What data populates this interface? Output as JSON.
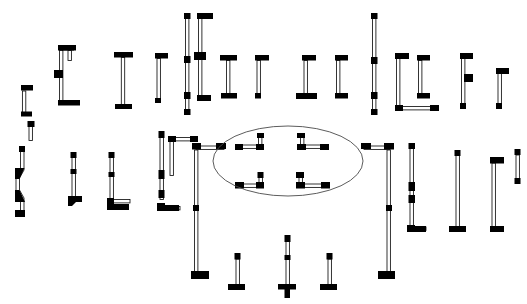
{
  "diagram": {
    "background_color": "#ffffff",
    "wall_line_color": "#111111",
    "wall_cap_color": "#000000",
    "wall_fill_color": "#ffffff",
    "highlight_color": "#4a4a4a",
    "canvas": {
      "width": 527,
      "height": 304
    },
    "annotation": {
      "shape": "ellipse",
      "name": "center-highlight-ellipse",
      "cx": 288,
      "cy": 161,
      "rx": 75,
      "ry": 35,
      "stroke": "#4a4a4a"
    },
    "legend": {
      "cap_label": "end cap",
      "body_label": "wall body",
      "joint_label": "joint marker"
    },
    "counts": {
      "total_segments": 46,
      "highlighted_segments": 4,
      "rows": 4
    }
  },
  "segments": [
    {
      "id": "s01",
      "name": "corner-top-left-small",
      "row": 1,
      "x": 22,
      "y": 85,
      "w": 12,
      "h": 28,
      "type": "corner-TL",
      "thickness": 4
    },
    {
      "id": "s02",
      "name": "bracket-left-open-right",
      "row": 1,
      "x": 55,
      "y": 45,
      "w": 22,
      "h": 60,
      "type": "bracket-C",
      "thickness": 4,
      "joint": "mid-left"
    },
    {
      "id": "s03",
      "name": "tee-vertical-top",
      "row": 1,
      "x": 110,
      "y": 52,
      "w": 20,
      "h": 58,
      "type": "tee-top",
      "thickness": 4
    },
    {
      "id": "s04",
      "name": "corner-top-right-thin",
      "row": 1,
      "x": 152,
      "y": 53,
      "w": 12,
      "h": 48,
      "type": "corner-TR",
      "thickness": 4
    },
    {
      "id": "s05",
      "name": "long-vertical-left",
      "row": 1,
      "x": 184,
      "y": 13,
      "w": 8,
      "h": 103,
      "type": "line-V",
      "thickness": 4
    },
    {
      "id": "s06",
      "name": "bracket-tall-open-right",
      "row": 1,
      "x": 214,
      "y": 13,
      "w": 18,
      "h": 87,
      "type": "bracket-C",
      "thickness": 4,
      "joint": "mid-left"
    },
    {
      "id": "s07",
      "name": "tee-vertical-short",
      "row": 1,
      "x": 250,
      "y": 55,
      "w": 16,
      "h": 46,
      "type": "tee-top",
      "thickness": 4
    },
    {
      "id": "s08",
      "name": "corner-bottom-right",
      "row": 1,
      "x": 290,
      "y": 55,
      "w": 22,
      "h": 46,
      "type": "corner-BR",
      "thickness": 4
    },
    {
      "id": "s09",
      "name": "bracket-mid-open-right",
      "row": 1,
      "x": 324,
      "y": 55,
      "w": 14,
      "h": 46,
      "type": "bracket-C",
      "thickness": 4
    },
    {
      "id": "s10",
      "name": "long-vertical-right",
      "row": 1,
      "x": 357,
      "y": 13,
      "w": 8,
      "h": 103,
      "type": "line-V",
      "thickness": 4
    },
    {
      "id": "s11",
      "name": "corner-tall-bottom-right",
      "row": 1,
      "x": 386,
      "y": 53,
      "w": 30,
      "h": 60,
      "type": "corner-BR",
      "thickness": 4
    },
    {
      "id": "s12",
      "name": "bracket-right-joint",
      "row": 1,
      "x": 452,
      "y": 53,
      "w": 14,
      "h": 60,
      "type": "bracket-C",
      "thickness": 4,
      "joint": "mid-right"
    },
    {
      "id": "s13",
      "name": "corner-top-right-far",
      "row": 1,
      "x": 494,
      "y": 68,
      "w": 12,
      "h": 42,
      "type": "corner-TR",
      "thickness": 4
    },
    {
      "id": "s14",
      "name": "zigzag-wall-left",
      "row": 2,
      "x": 14,
      "y": 148,
      "w": 14,
      "h": 72,
      "type": "zigzag-V",
      "thickness": 4
    },
    {
      "id": "s15",
      "name": "tee-foot-small",
      "row": 2,
      "x": 68,
      "y": 152,
      "w": 14,
      "h": 60,
      "type": "foot-L",
      "thickness": 4
    },
    {
      "id": "s16",
      "name": "corner-bottom-left-mid",
      "row": 2,
      "x": 105,
      "y": 152,
      "w": 20,
      "h": 62,
      "type": "corner-BR",
      "thickness": 4
    },
    {
      "id": "s17",
      "name": "corner-bottom-left-tall",
      "row": 2,
      "x": 155,
      "y": 132,
      "w": 18,
      "h": 80,
      "type": "corner-BR",
      "thickness": 4
    },
    {
      "id": "s18",
      "name": "bracket-large-left",
      "row": 2,
      "x": 192,
      "y": 188,
      "w": 38,
      "h": 86,
      "type": "bracket-U",
      "thickness": 4
    },
    {
      "id": "s19",
      "name": "ellipse-corner-top-left",
      "row": 2,
      "x": 236,
      "y": 134,
      "w": 28,
      "h": 16,
      "type": "corner-BR-small",
      "thickness": 4,
      "highlighted": true
    },
    {
      "id": "s20",
      "name": "ellipse-corner-top-right",
      "row": 2,
      "x": 298,
      "y": 134,
      "w": 30,
      "h": 16,
      "type": "corner-BL-small",
      "thickness": 4,
      "highlighted": true
    },
    {
      "id": "s21",
      "name": "ellipse-corner-bottom-left",
      "row": 2,
      "x": 238,
      "y": 172,
      "w": 30,
      "h": 16,
      "type": "corner-TR-small",
      "thickness": 4,
      "highlighted": true
    },
    {
      "id": "s22",
      "name": "ellipse-corner-bottom-right",
      "row": 2,
      "x": 296,
      "y": 172,
      "w": 32,
      "h": 16,
      "type": "corner-TL-small",
      "thickness": 4,
      "highlighted": true
    },
    {
      "id": "s23",
      "name": "bracket-large-right",
      "row": 2,
      "x": 358,
      "y": 188,
      "w": 38,
      "h": 86,
      "type": "bracket-U-R",
      "thickness": 4
    },
    {
      "id": "s24",
      "name": "corner-bottom-left-right1",
      "row": 2,
      "x": 404,
      "y": 134,
      "w": 18,
      "h": 98,
      "type": "corner-BR",
      "thickness": 4,
      "joint": "mid"
    },
    {
      "id": "s25",
      "name": "tee-foot-right",
      "row": 2,
      "x": 450,
      "y": 156,
      "w": 16,
      "h": 76,
      "type": "tee-bottom",
      "thickness": 4
    },
    {
      "id": "s26",
      "name": "corner-bottom-left-far",
      "row": 2,
      "x": 486,
      "y": 162,
      "w": 16,
      "h": 70,
      "type": "corner-BL",
      "thickness": 4
    },
    {
      "id": "s27",
      "name": "short-vertical-far-right",
      "row": 2,
      "x": 510,
      "y": 150,
      "w": 6,
      "h": 34,
      "type": "line-V",
      "thickness": 4
    },
    {
      "id": "s28",
      "name": "tee-bottom-a",
      "row": 3,
      "x": 228,
      "y": 254,
      "w": 16,
      "h": 38,
      "type": "tee-bottom",
      "thickness": 4
    },
    {
      "id": "s29",
      "name": "cross-joint-center",
      "row": 3,
      "x": 278,
      "y": 236,
      "w": 18,
      "h": 56,
      "type": "cross",
      "thickness": 4
    },
    {
      "id": "s30",
      "name": "tee-bottom-b",
      "row": 3,
      "x": 320,
      "y": 254,
      "w": 16,
      "h": 38,
      "type": "tee-bottom",
      "thickness": 4
    },
    {
      "id": "s31",
      "name": "top-left-corner-a",
      "row": 0,
      "x": 62,
      "y": 45,
      "w": 10,
      "h": 10,
      "type": "corner-TL",
      "thickness": 4
    },
    {
      "id": "s32",
      "name": "top-row-bracket-b",
      "row": 0,
      "x": 415,
      "y": 55,
      "w": 14,
      "h": 46,
      "type": "bracket-C",
      "thickness": 4
    },
    {
      "id": "s33",
      "name": "mid-left-L-a",
      "row": 2,
      "x": 122,
      "y": 130,
      "w": 10,
      "h": 12,
      "type": "corner-TR",
      "thickness": 4
    }
  ],
  "rows": [
    {
      "index": 1,
      "label": "top row",
      "y_center": 65,
      "count": 13
    },
    {
      "index": 2,
      "label": "middle row",
      "y_center": 175,
      "count": 14
    },
    {
      "index": 3,
      "label": "bottom row",
      "y_center": 270,
      "count": 3
    }
  ]
}
